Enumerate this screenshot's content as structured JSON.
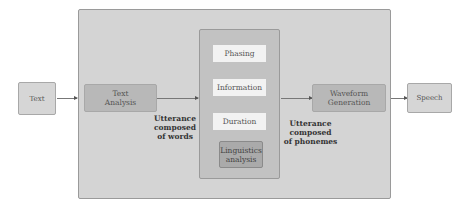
{
  "diagram": {
    "input": "Text",
    "output": "Speech",
    "stages": {
      "text_analysis": [
        "Text",
        "Analysis"
      ],
      "waveform_generation": [
        "Waveform",
        "Generation"
      ]
    },
    "middle_items": [
      "Phasing",
      "Information",
      "Duration"
    ],
    "linguistics": [
      "Linguistics",
      "analysis"
    ],
    "labels": {
      "words": [
        "Utterance",
        "composed",
        "of words"
      ],
      "phonemes": [
        "Utterance",
        "composed",
        "of phonemes"
      ]
    }
  }
}
